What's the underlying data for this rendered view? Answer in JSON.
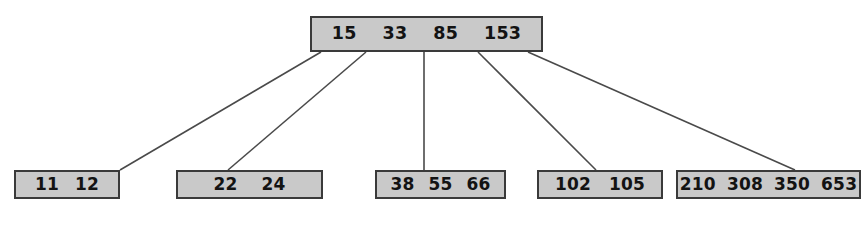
{
  "diagram": {
    "type": "tree",
    "colors": {
      "node_fill": "#c9c9c9",
      "node_border": "#3a3a3a",
      "edge": "#4a4a4a",
      "text": "#131313",
      "background": "#ffffff"
    },
    "nodes": [
      {
        "id": "root",
        "role": "root",
        "keys": [
          "15",
          "33",
          "85",
          "153"
        ],
        "x": 310,
        "y": 16,
        "w": 233,
        "h": 36
      },
      {
        "id": "leaf1",
        "role": "leaf",
        "keys": [
          "11",
          "12"
        ],
        "x": 14,
        "y": 170,
        "w": 106,
        "h": 29
      },
      {
        "id": "leaf2",
        "role": "leaf",
        "keys": [
          "22",
          "24"
        ],
        "x": 176,
        "y": 170,
        "w": 147,
        "h": 29
      },
      {
        "id": "leaf3",
        "role": "leaf",
        "keys": [
          "38",
          "55",
          "66"
        ],
        "x": 375,
        "y": 170,
        "w": 131,
        "h": 29
      },
      {
        "id": "leaf4",
        "role": "leaf",
        "keys": [
          "102",
          "105"
        ],
        "x": 537,
        "y": 170,
        "w": 126,
        "h": 29
      },
      {
        "id": "leaf5",
        "role": "leaf",
        "keys": [
          "210",
          "308",
          "350",
          "653"
        ],
        "x": 676,
        "y": 170,
        "w": 185,
        "h": 29
      }
    ],
    "edges": [
      {
        "from": "root",
        "to": "leaf1",
        "x1": 321,
        "y1": 52,
        "x2": 120,
        "y2": 170
      },
      {
        "from": "root",
        "to": "leaf2",
        "x1": 366,
        "y1": 52,
        "x2": 228,
        "y2": 170
      },
      {
        "from": "root",
        "to": "leaf3",
        "x1": 424,
        "y1": 52,
        "x2": 424,
        "y2": 170
      },
      {
        "from": "root",
        "to": "leaf4",
        "x1": 478,
        "y1": 52,
        "x2": 596,
        "y2": 170
      },
      {
        "from": "root",
        "to": "leaf5",
        "x1": 528,
        "y1": 52,
        "x2": 795,
        "y2": 170
      }
    ]
  }
}
